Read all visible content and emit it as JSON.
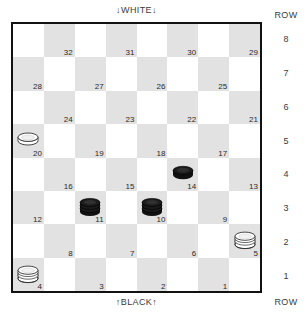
{
  "labels": {
    "top": "↓WHITE↓",
    "bottom": "↑BLACK↑",
    "row_head_top": "ROW",
    "row_head_bottom": "ROW"
  },
  "rows": [
    "8",
    "7",
    "6",
    "5",
    "4",
    "3",
    "2",
    "1"
  ],
  "colors": {
    "light_square": "#ffffff",
    "dark_square": "#e2e2e2",
    "border": "#111111",
    "black_piece": "#111111",
    "white_piece": "#ffffff",
    "text": "#2a2a2a"
  },
  "board": {
    "size": 8,
    "squares": [
      {
        "num": "32",
        "row": 8,
        "col": 2,
        "piece": null
      },
      {
        "num": "31",
        "row": 8,
        "col": 4,
        "piece": null
      },
      {
        "num": "30",
        "row": 8,
        "col": 6,
        "piece": null
      },
      {
        "num": "29",
        "row": 8,
        "col": 8,
        "piece": null
      },
      {
        "num": "28",
        "row": 7,
        "col": 1,
        "piece": null
      },
      {
        "num": "27",
        "row": 7,
        "col": 3,
        "piece": null
      },
      {
        "num": "26",
        "row": 7,
        "col": 5,
        "piece": null
      },
      {
        "num": "25",
        "row": 7,
        "col": 7,
        "piece": null
      },
      {
        "num": "24",
        "row": 6,
        "col": 2,
        "piece": null
      },
      {
        "num": "23",
        "row": 6,
        "col": 4,
        "piece": null
      },
      {
        "num": "22",
        "row": 6,
        "col": 6,
        "piece": null
      },
      {
        "num": "21",
        "row": 6,
        "col": 8,
        "piece": null
      },
      {
        "num": "20",
        "row": 5,
        "col": 1,
        "piece": "white-man"
      },
      {
        "num": "19",
        "row": 5,
        "col": 3,
        "piece": null
      },
      {
        "num": "18",
        "row": 5,
        "col": 5,
        "piece": null
      },
      {
        "num": "17",
        "row": 5,
        "col": 7,
        "piece": null
      },
      {
        "num": "16",
        "row": 4,
        "col": 2,
        "piece": null
      },
      {
        "num": "15",
        "row": 4,
        "col": 4,
        "piece": null
      },
      {
        "num": "14",
        "row": 4,
        "col": 6,
        "piece": "black-man"
      },
      {
        "num": "13",
        "row": 4,
        "col": 8,
        "piece": null
      },
      {
        "num": "12",
        "row": 3,
        "col": 1,
        "piece": null
      },
      {
        "num": "11",
        "row": 3,
        "col": 3,
        "piece": "black-king"
      },
      {
        "num": "10",
        "row": 3,
        "col": 5,
        "piece": "black-king"
      },
      {
        "num": "9",
        "row": 3,
        "col": 7,
        "piece": null
      },
      {
        "num": "8",
        "row": 2,
        "col": 2,
        "piece": null
      },
      {
        "num": "7",
        "row": 2,
        "col": 4,
        "piece": null
      },
      {
        "num": "6",
        "row": 2,
        "col": 6,
        "piece": null
      },
      {
        "num": "5",
        "row": 2,
        "col": 8,
        "piece": "white-king"
      },
      {
        "num": "4",
        "row": 1,
        "col": 1,
        "piece": "white-king"
      },
      {
        "num": "3",
        "row": 1,
        "col": 3,
        "piece": null
      },
      {
        "num": "2",
        "row": 1,
        "col": 5,
        "piece": null
      },
      {
        "num": "1",
        "row": 1,
        "col": 7,
        "piece": null
      }
    ]
  },
  "pieces_summary": {
    "white_men": [
      "20"
    ],
    "white_kings": [
      "4",
      "5"
    ],
    "black_men": [
      "14"
    ],
    "black_kings": [
      "10",
      "11"
    ]
  }
}
